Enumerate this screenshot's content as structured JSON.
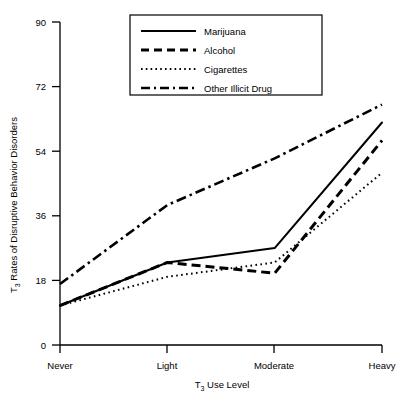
{
  "chart_data": {
    "type": "line",
    "title": "",
    "xlabel": "T3 Use Level",
    "xlabel_main": "T",
    "xlabel_sub": "3",
    "xlabel_rest": " Use Level",
    "ylabel": "T3 Rates of Disruptive Behavior Disorders",
    "ylabel_main": "T",
    "ylabel_sub": "3",
    "ylabel_rest": " Rates of Disruptive Behavior Disorders",
    "categories": [
      "Never",
      "Light",
      "Moderate",
      "Heavy"
    ],
    "xticklabels": [
      "Never",
      "Light",
      "Moderate",
      "Heavy"
    ],
    "yticklabels": [
      "0",
      "18",
      "36",
      "54",
      "72",
      "90"
    ],
    "ytickvalues": [
      0,
      18,
      36,
      54,
      72,
      90
    ],
    "ylim": [
      0,
      90
    ],
    "grid": false,
    "legend_position": "top-center",
    "series": [
      {
        "name": "Marijuana",
        "linestyle": "solid",
        "values": [
          11,
          23,
          27,
          62
        ]
      },
      {
        "name": "Alcohol",
        "linestyle": "dashed",
        "values": [
          11,
          23,
          20,
          57
        ]
      },
      {
        "name": "Cigarettes",
        "linestyle": "dotted",
        "values": [
          11,
          19,
          23,
          48
        ]
      },
      {
        "name": "Other Illicit Drug",
        "linestyle": "dashdot",
        "values": [
          17,
          39,
          52,
          67
        ]
      }
    ]
  },
  "legend": {
    "items": [
      {
        "label": "Marijuana",
        "style": "solid"
      },
      {
        "label": "Alcohol",
        "style": "dashed"
      },
      {
        "label": "Cigarettes",
        "style": "dotted"
      },
      {
        "label": "Other Illicit Drug",
        "style": "dashdot"
      }
    ]
  },
  "axes": {
    "y_ticks": [
      "90",
      "72",
      "54",
      "36",
      "18",
      "0"
    ],
    "x_ticks": [
      "Never",
      "Light",
      "Moderate",
      "Heavy"
    ]
  },
  "colors": {
    "line": "#000000",
    "axis": "#000000",
    "background": "#ffffff"
  }
}
